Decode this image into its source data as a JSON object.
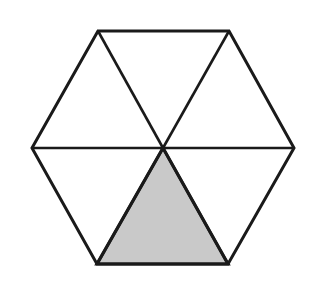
{
  "figure": {
    "kind": "geometry-diagram",
    "shape_name": "hexagon",
    "background_color": "#ffffff",
    "canvas": {
      "width": 310,
      "height": 284
    },
    "stroke": {
      "color": "#1a1a1a",
      "outline_width": 3,
      "spoke_width": 2.6,
      "shaded_edge_width": 3.2
    },
    "shaded_fill_color": "#c9c9c9",
    "unshaded_fill_color": "#ffffff",
    "total_parts": 6,
    "shaded_parts": 1,
    "fraction_shaded": "1/6",
    "center_point": {
      "x": 163,
      "y": 148
    },
    "vertices": [
      {
        "name": "left",
        "x": 32,
        "y": 148
      },
      {
        "name": "top-left",
        "x": 98,
        "y": 31
      },
      {
        "name": "top-right",
        "x": 229,
        "y": 31
      },
      {
        "name": "right",
        "x": 294,
        "y": 148
      },
      {
        "name": "bottom-right",
        "x": 228,
        "y": 264
      },
      {
        "name": "bottom-left",
        "x": 97,
        "y": 264
      }
    ],
    "outline_points": "32,148 98,31 229,31 294,148 228,264 97,264",
    "spokes": [
      {
        "name": "spoke-to-left",
        "x1": 163,
        "y1": 148,
        "x2": 32,
        "y2": 148
      },
      {
        "name": "spoke-to-top-left",
        "x1": 163,
        "y1": 148,
        "x2": 98,
        "y2": 31
      },
      {
        "name": "spoke-to-top-right",
        "x1": 163,
        "y1": 148,
        "x2": 229,
        "y2": 31
      },
      {
        "name": "spoke-to-right",
        "x1": 163,
        "y1": 148,
        "x2": 294,
        "y2": 148
      },
      {
        "name": "spoke-to-bottom-right",
        "x1": 163,
        "y1": 148,
        "x2": 228,
        "y2": 264
      },
      {
        "name": "spoke-to-bottom-left",
        "x1": 163,
        "y1": 148,
        "x2": 97,
        "y2": 264
      }
    ],
    "sectors": [
      {
        "name": "sector-upper-left",
        "position": "upper-left",
        "points": "163,148 32,148 98,31",
        "shaded": false,
        "fill": "#ffffff"
      },
      {
        "name": "sector-top",
        "position": "top",
        "points": "163,148 98,31 229,31",
        "shaded": false,
        "fill": "#ffffff"
      },
      {
        "name": "sector-upper-right",
        "position": "upper-right",
        "points": "163,148 229,31 294,148",
        "shaded": false,
        "fill": "#ffffff"
      },
      {
        "name": "sector-lower-right",
        "position": "lower-right",
        "points": "163,148 294,148 228,264",
        "shaded": false,
        "fill": "#ffffff"
      },
      {
        "name": "sector-bottom",
        "position": "bottom",
        "points": "163,148 228,264 97,264",
        "shaded": true,
        "fill": "#c9c9c9"
      },
      {
        "name": "sector-lower-left",
        "position": "lower-left",
        "points": "163,148 97,264 32,148",
        "shaded": false,
        "fill": "#ffffff"
      }
    ]
  }
}
